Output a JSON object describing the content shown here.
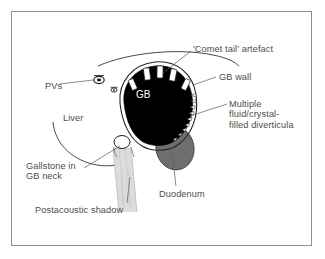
{
  "figure": {
    "background_color": "#ffffff",
    "frame_color": "#8d8d8d",
    "label_color": "#4c4c4c",
    "lumen_color": "#000000",
    "duodenum_color": "#6e6e6e",
    "shadow_color": "#d8d8d8",
    "diverticula_color": "#ffffff"
  },
  "labels": {
    "comet_tail": "'Comet tail' artefact",
    "gb_wall": "GB wall",
    "multiple_diverticula": "Multiple\nfluid/crystal-\nfilled diverticula",
    "pvs": "PVs",
    "liver": "Liver",
    "gallstone": "Gallstone in\n  GB neck",
    "duodenum": "Duodenum",
    "postacoustic_shadow": "Postacoustic shadow",
    "gb": "GB"
  },
  "structures": [
    {
      "name": "liver-capsule-arc",
      "kind": "outline"
    },
    {
      "name": "liver-inferior-edge-arc",
      "kind": "outline"
    },
    {
      "name": "gallbladder-lumen",
      "kind": "filled",
      "color": "#000000"
    },
    {
      "name": "gallbladder-wall",
      "kind": "outline"
    },
    {
      "name": "fundal-diverticula",
      "kind": "filled",
      "color": "#ffffff",
      "count": 4
    },
    {
      "name": "mural-diverticula-notches",
      "kind": "filled",
      "color": "#ffffff",
      "count": 9
    },
    {
      "name": "gallstone",
      "kind": "filled",
      "color": "#ffffff"
    },
    {
      "name": "postacoustic-shadow-band",
      "kind": "filled",
      "color": "#d8d8d8"
    },
    {
      "name": "duodenum",
      "kind": "filled",
      "color": "#6e6e6e"
    },
    {
      "name": "portal-vein-large",
      "kind": "marker"
    },
    {
      "name": "portal-vein-small",
      "kind": "marker"
    }
  ]
}
